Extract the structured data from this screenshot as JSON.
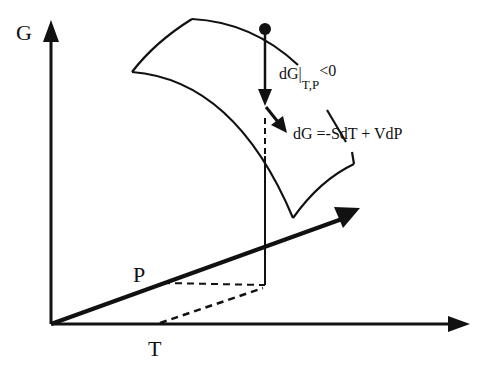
{
  "diagram": {
    "axes": {
      "vertical": {
        "label": "G"
      },
      "depth": {
        "label": "P"
      },
      "horizontal": {
        "label": "T"
      }
    },
    "annotations": {
      "spontaneous": {
        "main": "dG|",
        "subscript": "T,P",
        "superscript": "<0"
      },
      "surface_equation": "dG =-SdT + VdP"
    },
    "elements": [
      "G axis arrow",
      "T axis arrow",
      "P axis arrow",
      "curved surface patch",
      "state point (filled dot) above surface",
      "downward arrow from point to surface",
      "pointer arrow to surface equation",
      "dashed projection lines to T and P axes"
    ],
    "colors": {
      "ink": "#111111",
      "background": "#ffffff"
    }
  }
}
